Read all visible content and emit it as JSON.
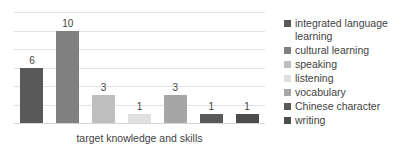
{
  "chart_data": {
    "type": "bar",
    "title": "",
    "subtitle": "",
    "xlabel": "target knowledge and skills",
    "ylabel": "",
    "categories": [
      "integrated language learning",
      "cultural learning",
      "speaking",
      "listening",
      "vocabulary",
      "Chinese character",
      "writing"
    ],
    "values": [
      6,
      10,
      3,
      1,
      3,
      1,
      1
    ],
    "data_labels": [
      "6",
      "10",
      "3",
      "1",
      "3",
      "1",
      "1"
    ],
    "ylim": [
      0,
      12
    ],
    "gridlines": [
      0,
      2,
      4,
      6,
      8,
      10,
      12
    ],
    "grid": true,
    "axis_tick_labels": [],
    "legend_position": "right",
    "series_colors": [
      "#595959",
      "#808080",
      "#bfbfbf",
      "#e0e0e0",
      "#a6a6a6",
      "#595959",
      "#4d4d4d"
    ]
  },
  "legend": {
    "items": [
      {
        "label": "integrated language learning",
        "color": "#595959"
      },
      {
        "label": "cultural learning",
        "color": "#808080"
      },
      {
        "label": "speaking",
        "color": "#bfbfbf"
      },
      {
        "label": "listening",
        "color": "#e0e0e0"
      },
      {
        "label": "vocabulary",
        "color": "#a6a6a6"
      },
      {
        "label": "Chinese character",
        "color": "#595959"
      },
      {
        "label": "writing",
        "color": "#4d4d4d"
      }
    ]
  }
}
